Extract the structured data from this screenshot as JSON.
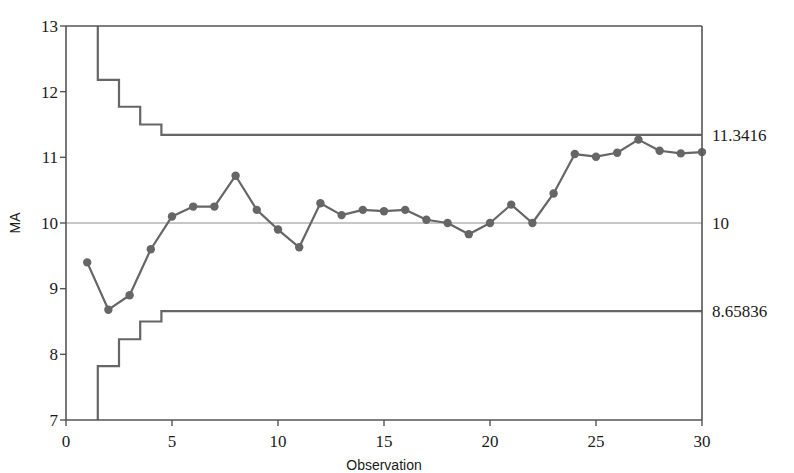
{
  "chart_data": {
    "type": "line",
    "title": "",
    "xlabel": "Observation",
    "ylabel": "MA",
    "xlim": [
      0,
      30
    ],
    "ylim": [
      7,
      13
    ],
    "xticks": [
      0,
      5,
      10,
      15,
      20,
      25,
      30
    ],
    "xtick_labels": [
      "0",
      "5",
      "10",
      "15",
      "20",
      "25",
      "30"
    ],
    "yticks": [
      7,
      8,
      9,
      10,
      11,
      12,
      13
    ],
    "ytick_labels": [
      "7",
      "8",
      "9",
      "10",
      "11",
      "12",
      "13"
    ],
    "grid": false,
    "legend": "none",
    "x": [
      1,
      2,
      3,
      4,
      5,
      6,
      7,
      8,
      9,
      10,
      11,
      12,
      13,
      14,
      15,
      16,
      17,
      18,
      19,
      20,
      21,
      22,
      23,
      24,
      25,
      26,
      27,
      28,
      29,
      30
    ],
    "series": [
      {
        "name": "MA",
        "marker": "filled-circle",
        "color": "#666666",
        "values": [
          9.4,
          8.68,
          8.9,
          9.6,
          10.1,
          10.25,
          10.25,
          10.72,
          10.2,
          9.9,
          9.63,
          10.3,
          10.12,
          10.2,
          10.18,
          10.2,
          10.05,
          10.0,
          9.83,
          10.0,
          10.28,
          10.0,
          10.45,
          11.05,
          11.01,
          11.07,
          11.27,
          11.1,
          11.06,
          11.08
        ]
      }
    ],
    "center_line": {
      "name": "Center line",
      "value": 10,
      "label": "10",
      "color": "#808080"
    },
    "upper_control_limit": {
      "name": "UCL",
      "label": "11.3416",
      "steady_value": 11.3416,
      "color": "#666666",
      "step_values": [
        13.55,
        12.18,
        11.77,
        11.5,
        11.3416,
        11.3416,
        11.3416,
        11.3416,
        11.3416,
        11.3416,
        11.3416,
        11.3416,
        11.3416,
        11.3416,
        11.3416,
        11.3416,
        11.3416,
        11.3416,
        11.3416,
        11.3416,
        11.3416,
        11.3416,
        11.3416,
        11.3416,
        11.3416,
        11.3416,
        11.3416,
        11.3416,
        11.3416,
        11.3416
      ]
    },
    "lower_control_limit": {
      "name": "LCL",
      "label": "8.65836",
      "steady_value": 8.65836,
      "color": "#666666",
      "step_values": [
        6.45,
        7.82,
        8.23,
        8.5,
        8.65836,
        8.65836,
        8.65836,
        8.65836,
        8.65836,
        8.65836,
        8.65836,
        8.65836,
        8.65836,
        8.65836,
        8.65836,
        8.65836,
        8.65836,
        8.65836,
        8.65836,
        8.65836,
        8.65836,
        8.65836,
        8.65836,
        8.65836,
        8.65836,
        8.65836,
        8.65836,
        8.65836,
        8.65836,
        8.65836
      ]
    }
  },
  "labels": {
    "y_axis_title": "MA",
    "x_axis_title": "Observation",
    "ucl_value": "11.3416",
    "center_value": "10",
    "lcl_value": "8.65836",
    "ytick_13": "13",
    "ytick_12": "12",
    "ytick_11": "11",
    "ytick_10": "10",
    "ytick_9": "9",
    "ytick_8": "8",
    "ytick_7": "7",
    "xtick_0": "0",
    "xtick_5": "5",
    "xtick_10": "10",
    "xtick_15": "15",
    "xtick_20": "20",
    "xtick_25": "25",
    "xtick_30": "30"
  },
  "colors": {
    "axis": "#555555",
    "series": "#666666",
    "center": "#909090",
    "limits": "#666666",
    "text": "#1a1a1a",
    "background": "#ffffff"
  }
}
